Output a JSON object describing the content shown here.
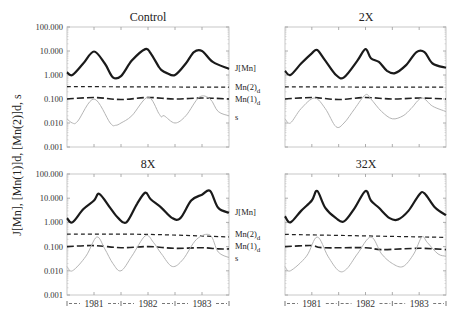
{
  "chart_data": [
    {
      "type": "line",
      "title": "Control",
      "ylabel": "J[Mn], [Mn(1)]d, [Mn(2)]d, s",
      "yscale": "log",
      "ylim": [
        0.001,
        100
      ],
      "yticks": [
        "100.000",
        "10.000",
        "1.000",
        "0.100",
        "0.010",
        "0.001"
      ],
      "xlim": [
        1981,
        1984
      ],
      "xticks": [
        "1981",
        "1982",
        "1983"
      ],
      "legend_position": "right",
      "series": [
        {
          "name": "J[Mn]",
          "style": "solid-thick",
          "x": [
            0,
            0.1,
            0.3,
            0.5,
            0.7,
            0.85,
            1.0,
            1.2,
            1.45,
            1.55,
            1.7,
            1.75,
            1.85,
            2.0,
            2.2,
            2.35,
            2.5,
            2.7,
            3.0
          ],
          "values": [
            1.3,
            1.0,
            3.0,
            9.5,
            3.0,
            0.8,
            0.9,
            4.0,
            12.0,
            8.0,
            2.2,
            1.6,
            1.2,
            1.0,
            3.0,
            9.0,
            10.0,
            3.5,
            1.8
          ]
        },
        {
          "name": "Mn(2)d",
          "style": "dashed-short",
          "x": [
            0,
            3
          ],
          "values": [
            0.33,
            0.31
          ]
        },
        {
          "name": "Mn(1)d",
          "style": "dashed-long",
          "x": [
            0,
            0.5,
            1.0,
            1.5,
            2.0,
            2.5,
            3.0
          ],
          "values": [
            0.1,
            0.115,
            0.095,
            0.115,
            0.1,
            0.11,
            0.1
          ]
        },
        {
          "name": "s",
          "style": "solid-thin-gray",
          "x": [
            0,
            0.1,
            0.2,
            0.5,
            0.8,
            0.9,
            1.0,
            1.2,
            1.5,
            1.7,
            1.75,
            1.8,
            2.0,
            2.2,
            2.45,
            2.65,
            2.8,
            3.0
          ],
          "values": [
            0.015,
            0.01,
            0.012,
            0.1,
            0.01,
            0.008,
            0.01,
            0.02,
            0.12,
            0.025,
            0.018,
            0.02,
            0.01,
            0.02,
            0.12,
            0.1,
            0.03,
            0.02
          ]
        }
      ]
    },
    {
      "type": "line",
      "title": "2X",
      "yscale": "log",
      "ylim": [
        0.001,
        100
      ],
      "xlim": [
        1981,
        1984
      ],
      "series": [
        {
          "name": "J[Mn]",
          "style": "solid-thick",
          "x": [
            0,
            0.1,
            0.3,
            0.5,
            0.6,
            0.75,
            0.95,
            1.1,
            1.35,
            1.5,
            1.6,
            1.75,
            1.9,
            2.05,
            2.25,
            2.45,
            2.6,
            2.75,
            3.0
          ],
          "values": [
            1.5,
            1.0,
            3.0,
            8.0,
            11.0,
            4.0,
            1.0,
            0.8,
            4.0,
            12.0,
            5.0,
            3.5,
            1.5,
            1.2,
            2.5,
            9.0,
            9.0,
            3.0,
            2.0
          ]
        },
        {
          "name": "Mn(2)d",
          "style": "dashed-short",
          "x": [
            0,
            3
          ],
          "values": [
            0.32,
            0.31
          ]
        },
        {
          "name": "Mn(1)d",
          "style": "dashed-long",
          "x": [
            0,
            0.5,
            1.0,
            1.5,
            2.0,
            2.5,
            3.0
          ],
          "values": [
            0.1,
            0.115,
            0.095,
            0.115,
            0.1,
            0.11,
            0.1
          ]
        },
        {
          "name": "s",
          "style": "solid-thin-gray",
          "x": [
            0,
            0.1,
            0.3,
            0.55,
            0.75,
            0.95,
            1.1,
            1.3,
            1.5,
            1.6,
            1.8,
            2.0,
            2.2,
            2.35,
            2.55,
            2.75,
            3.0
          ],
          "values": [
            0.015,
            0.01,
            0.04,
            0.11,
            0.04,
            0.007,
            0.01,
            0.04,
            0.15,
            0.1,
            0.03,
            0.015,
            0.02,
            0.04,
            0.11,
            0.05,
            0.03
          ]
        }
      ]
    },
    {
      "type": "line",
      "title": "8X",
      "yscale": "log",
      "ylim": [
        0.001,
        100
      ],
      "xlim": [
        1981,
        1984
      ],
      "series": [
        {
          "name": "J[Mn]",
          "style": "solid-thick",
          "x": [
            0,
            0.1,
            0.3,
            0.5,
            0.6,
            0.8,
            0.95,
            1.1,
            1.3,
            1.45,
            1.55,
            1.75,
            1.95,
            2.1,
            2.3,
            2.5,
            2.65,
            2.8,
            3.0
          ],
          "values": [
            1.5,
            1.0,
            3.5,
            8.0,
            15.0,
            4.0,
            1.5,
            1.0,
            6.0,
            17.0,
            9.0,
            4.0,
            1.5,
            1.5,
            8.0,
            14.0,
            20.0,
            4.0,
            2.5
          ]
        },
        {
          "name": "Mn(2)d",
          "style": "dashed-short",
          "x": [
            0,
            1.5,
            3
          ],
          "values": [
            0.33,
            0.32,
            0.25
          ]
        },
        {
          "name": "Mn(1)d",
          "style": "dashed-long",
          "x": [
            0,
            0.5,
            1.0,
            1.5,
            2.0,
            2.5,
            2.8,
            3.0
          ],
          "values": [
            0.1,
            0.11,
            0.09,
            0.1,
            0.085,
            0.09,
            0.08,
            0.08
          ]
        },
        {
          "name": "s",
          "style": "solid-thin-gray",
          "x": [
            0,
            0.1,
            0.35,
            0.55,
            0.7,
            0.85,
            1.0,
            1.2,
            1.45,
            1.6,
            1.75,
            1.95,
            2.15,
            2.4,
            2.65,
            2.8,
            3.0
          ],
          "values": [
            0.015,
            0.01,
            0.04,
            0.25,
            0.08,
            0.02,
            0.01,
            0.04,
            0.28,
            0.15,
            0.05,
            0.015,
            0.03,
            0.2,
            0.3,
            0.06,
            0.035
          ]
        }
      ]
    },
    {
      "type": "line",
      "title": "32X",
      "yscale": "log",
      "ylim": [
        0.001,
        100
      ],
      "xlim": [
        1981,
        1984
      ],
      "series": [
        {
          "name": "J[Mn]",
          "style": "solid-thick",
          "x": [
            0,
            0.1,
            0.3,
            0.5,
            0.6,
            0.75,
            0.95,
            1.1,
            1.3,
            1.5,
            1.6,
            1.75,
            1.95,
            2.1,
            2.3,
            2.5,
            2.6,
            2.8,
            3.0
          ],
          "values": [
            1.8,
            1.0,
            3.0,
            8.0,
            20.0,
            4.0,
            1.5,
            1.1,
            4.0,
            20.0,
            8.0,
            4.0,
            1.5,
            1.3,
            3.0,
            14.0,
            16.0,
            4.0,
            2.0
          ]
        },
        {
          "name": "Mn(2)d",
          "style": "dashed-short",
          "x": [
            0,
            3
          ],
          "values": [
            0.32,
            0.24
          ]
        },
        {
          "name": "Mn(1)d",
          "style": "dashed-long",
          "x": [
            0,
            0.5,
            0.7,
            1.5,
            1.8,
            2.5,
            3.0
          ],
          "values": [
            0.1,
            0.11,
            0.09,
            0.09,
            0.075,
            0.085,
            0.075
          ]
        },
        {
          "name": "s",
          "style": "solid-thin-gray",
          "x": [
            0,
            0.1,
            0.4,
            0.6,
            0.8,
            1.0,
            1.15,
            1.35,
            1.6,
            1.8,
            2.0,
            2.2,
            2.4,
            2.55,
            2.65,
            2.85,
            3.0
          ],
          "values": [
            0.015,
            0.01,
            0.04,
            0.25,
            0.04,
            0.01,
            0.012,
            0.05,
            0.25,
            0.05,
            0.02,
            0.015,
            0.05,
            0.25,
            0.15,
            0.05,
            0.04
          ]
        }
      ]
    }
  ],
  "figure": {
    "ylabel": "J[Mn], [Mn(1)]d, [Mn(2)]d, s",
    "yticks": [
      "100.000",
      "10.000",
      "1.000",
      "0.100",
      "0.010",
      "0.001"
    ],
    "x_axis_label": "|---1981---|---1982---|---1983---|",
    "years": [
      "1981",
      "1982",
      "1983"
    ],
    "legend": [
      {
        "label": "J[Mn]"
      },
      {
        "label": "Mn(2)",
        "sub": "d"
      },
      {
        "label": "Mn(1)",
        "sub": "d"
      },
      {
        "label": "s"
      }
    ],
    "panels": [
      {
        "title": "Control"
      },
      {
        "title": "2X"
      },
      {
        "title": "8X"
      },
      {
        "title": "32X"
      }
    ]
  }
}
